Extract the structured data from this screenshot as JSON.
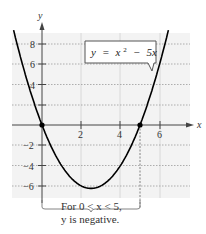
{
  "chart_data": {
    "type": "line",
    "title": "",
    "equation_label": "y = x² − 5x",
    "function": "y = x^2 - 5x",
    "xlabel": "x",
    "ylabel": "y",
    "x_ticks": [
      2,
      4,
      6
    ],
    "y_ticks": [
      -6,
      -4,
      -2,
      4,
      6,
      8
    ],
    "xlim": [
      -1.5,
      7.5
    ],
    "ylim": [
      -7,
      9
    ],
    "grid": true,
    "series": [
      {
        "name": "y = x^2 - 5x",
        "x": [
          -1,
          -0.5,
          0,
          0.5,
          1,
          1.5,
          2,
          2.5,
          3,
          3.5,
          4,
          4.5,
          5,
          5.5,
          6,
          6.25
        ],
        "y": [
          6,
          2.75,
          0,
          -2.25,
          -4,
          -5.25,
          -6,
          -6.25,
          -6,
          -5.25,
          -4,
          -2.25,
          0,
          2.75,
          6,
          7.8125
        ]
      }
    ],
    "highlighted_points": [
      {
        "x": 0,
        "y": 0
      },
      {
        "x": 5,
        "y": 0
      }
    ],
    "annotation": {
      "bracket_from_x": 0,
      "bracket_to_x": 5,
      "text_line1": "For 0 < x < 5,",
      "text_line2": "y is negative."
    }
  },
  "labels": {
    "x_axis": "x",
    "y_axis": "y",
    "x_tick_2": "2",
    "x_tick_4": "4",
    "x_tick_6": "6",
    "y_tick_8": "8",
    "y_tick_6": "6",
    "y_tick_4": "4",
    "y_tick_m2": "−2",
    "y_tick_m4": "−4",
    "y_tick_m6": "−6",
    "eq_y": "y",
    "eq_eq": "=",
    "eq_x": "x",
    "eq_sup": "2",
    "eq_minus": "−",
    "eq_5x": "5x",
    "caption_line1": "For 0 < x < 5,",
    "caption_line2": "y is negative."
  }
}
